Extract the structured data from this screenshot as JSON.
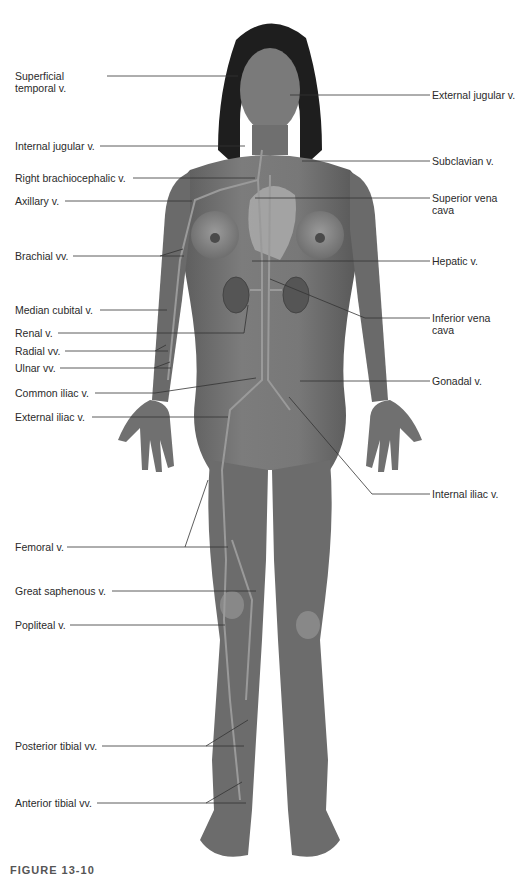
{
  "figure": {
    "caption": "FIGURE 13-10",
    "colors": {
      "skin": "#6e6e6e",
      "skin_light": "#9a9a9a",
      "hair": "#1e1e1e",
      "vein": "#8a8a8a",
      "leader_line": "#333333",
      "label_text": "#2a2a2a",
      "background": "#ffffff"
    }
  },
  "labels_left": [
    {
      "id": "superficial-temporal",
      "text": "Superficial temporal v.",
      "line1": "Superficial",
      "line2": "temporal v."
    },
    {
      "id": "internal-jugular",
      "text": "Internal jugular v."
    },
    {
      "id": "right-brachiocephalic",
      "text": "Right brachiocephalic v."
    },
    {
      "id": "axillary",
      "text": "Axillary v."
    },
    {
      "id": "brachial",
      "text": "Brachial vv."
    },
    {
      "id": "median-cubital",
      "text": "Median cubital v."
    },
    {
      "id": "renal",
      "text": "Renal v."
    },
    {
      "id": "radial",
      "text": "Radial vv."
    },
    {
      "id": "ulnar",
      "text": "Ulnar vv."
    },
    {
      "id": "common-iliac",
      "text": "Common iliac v."
    },
    {
      "id": "external-iliac",
      "text": "External iliac v."
    },
    {
      "id": "femoral",
      "text": "Femoral v."
    },
    {
      "id": "great-saphenous",
      "text": "Great saphenous v."
    },
    {
      "id": "popliteal",
      "text": "Popliteal v."
    },
    {
      "id": "posterior-tibial",
      "text": "Posterior tibial vv."
    },
    {
      "id": "anterior-tibial",
      "text": "Anterior tibial vv."
    }
  ],
  "labels_right": [
    {
      "id": "external-jugular",
      "text": "External jugular v."
    },
    {
      "id": "subclavian",
      "text": "Subclavian v."
    },
    {
      "id": "superior-vena-cava",
      "text": "Superior vena cava",
      "line1": "Superior vena",
      "line2": "cava"
    },
    {
      "id": "hepatic",
      "text": "Hepatic v."
    },
    {
      "id": "inferior-vena-cava",
      "text": "Inferior vena cava",
      "line1": "Inferior vena",
      "line2": "cava"
    },
    {
      "id": "gonadal",
      "text": "Gonadal v."
    },
    {
      "id": "internal-iliac",
      "text": "Internal iliac v."
    }
  ]
}
